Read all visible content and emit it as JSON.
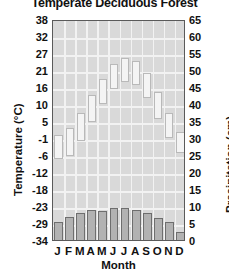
{
  "chart_data": {
    "type": "bar",
    "title": "Temperate Deciduous Forest",
    "xlabel": "Month",
    "categories": [
      "J",
      "F",
      "M",
      "A",
      "M",
      "J",
      "J",
      "A",
      "S",
      "O",
      "N",
      "D"
    ],
    "grid": true,
    "legend": "none",
    "axes": {
      "left": {
        "label": "Temperature (°C)",
        "unit": "°C",
        "ticks": [
          38,
          32,
          27,
          21,
          16,
          10,
          5,
          -1,
          -6,
          -12,
          -18,
          -23,
          -29,
          -34
        ],
        "range": [
          -34,
          38
        ]
      },
      "right": {
        "label": "Precipitation (cm)",
        "unit": "cm",
        "ticks": [
          65,
          60,
          55,
          50,
          45,
          40,
          35,
          30,
          25,
          20,
          15,
          10,
          5,
          0
        ],
        "range": [
          0,
          65
        ]
      }
    },
    "series": [
      {
        "name": "Temperature range",
        "type": "range-bar",
        "axis": "left",
        "unit": "°C",
        "low": [
          -7,
          -6,
          -1,
          5,
          11,
          16,
          18,
          17,
          13,
          6,
          0,
          -5
        ],
        "high": [
          1,
          3,
          8,
          14,
          19,
          24,
          26,
          25,
          21,
          15,
          8,
          2
        ]
      },
      {
        "name": "Precipitation",
        "type": "bar",
        "axis": "right",
        "unit": "cm",
        "values": [
          6.0,
          7.5,
          8.5,
          9.5,
          9.0,
          10.0,
          10.0,
          9.5,
          8.5,
          7.0,
          6.0,
          3.0
        ]
      }
    ]
  },
  "ticks_left": [
    "38",
    "32",
    "27",
    "21",
    "16",
    "10",
    "5",
    "-1",
    "-6",
    "-12",
    "-18",
    "-23",
    "-29",
    "-34"
  ],
  "ticks_right": [
    "65",
    "60",
    "55",
    "50",
    "45",
    "40",
    "35",
    "30",
    "25",
    "20",
    "15",
    "10",
    "5",
    "0"
  ]
}
